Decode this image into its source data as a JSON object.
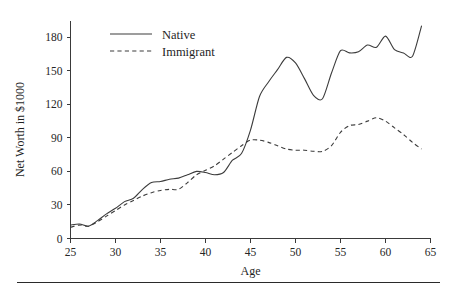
{
  "chart_data": {
    "type": "line",
    "title": "",
    "xlabel": "Age",
    "ylabel": "Net Worth in $1000",
    "xlim": [
      25,
      65
    ],
    "ylim": [
      0,
      195
    ],
    "xticks": [
      25,
      30,
      35,
      40,
      45,
      50,
      55,
      60,
      65
    ],
    "yticks": [
      0,
      30,
      60,
      90,
      120,
      150,
      180
    ],
    "grid": false,
    "legend_position": "upper left inside",
    "x": [
      25,
      26,
      27,
      28,
      29,
      30,
      31,
      32,
      33,
      34,
      35,
      36,
      37,
      38,
      39,
      40,
      41,
      42,
      43,
      44,
      45,
      46,
      47,
      48,
      49,
      50,
      51,
      52,
      53,
      54,
      55,
      56,
      57,
      58,
      59,
      60,
      61,
      62,
      63,
      64
    ],
    "series": [
      {
        "name": "Native",
        "style": "solid",
        "values": [
          12,
          13,
          11,
          16,
          22,
          27,
          33,
          36,
          44,
          50,
          51,
          53,
          54,
          57,
          60,
          59,
          57,
          59,
          70,
          76,
          97,
          127,
          140,
          151,
          162,
          157,
          143,
          128,
          125,
          148,
          168,
          166,
          167,
          173,
          171,
          181,
          169,
          166,
          163,
          190
        ]
      },
      {
        "name": "Immigrant",
        "style": "dashed",
        "values": [
          10,
          12,
          11,
          15,
          20,
          25,
          30,
          34,
          38,
          41,
          43,
          44,
          44,
          50,
          57,
          61,
          65,
          71,
          77,
          83,
          88,
          88,
          86,
          83,
          80,
          79,
          79,
          78,
          78,
          83,
          95,
          101,
          102,
          105,
          108,
          105,
          99,
          93,
          86,
          80
        ]
      }
    ]
  },
  "axis": {
    "ylabel": "Net Worth in $1000",
    "xlabel": "Age",
    "ytick_labels": [
      "0",
      "30",
      "60",
      "90",
      "120",
      "150",
      "180"
    ],
    "xtick_labels": [
      "25",
      "30",
      "35",
      "40",
      "45",
      "50",
      "55",
      "60",
      "65"
    ]
  },
  "legend": {
    "entries": [
      {
        "label": "Native",
        "style": "solid"
      },
      {
        "label": "Immigrant",
        "style": "dashed"
      }
    ]
  }
}
